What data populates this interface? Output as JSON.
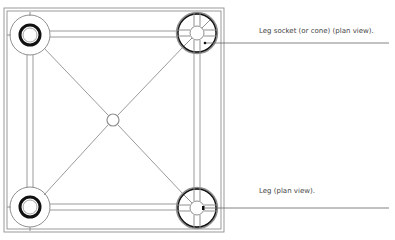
{
  "diagram": {
    "labels": {
      "socket": "Leg socket (or cone) (plan view).",
      "leg": "Leg (plan view)."
    },
    "colors": {
      "line": "#8a8a8a",
      "dark": "#111111",
      "background": "#ffffff"
    }
  }
}
